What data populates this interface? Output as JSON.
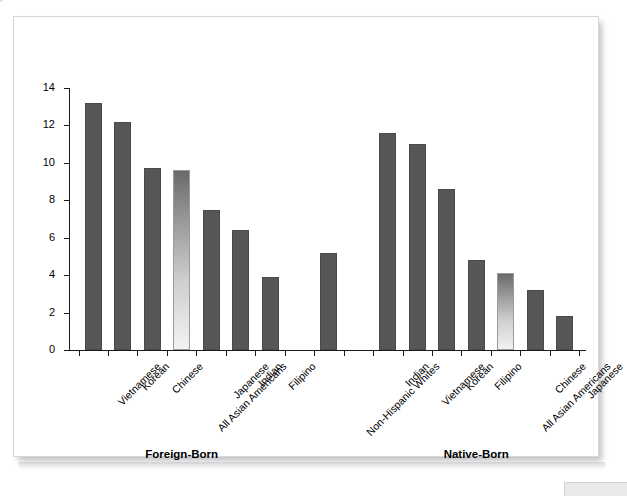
{
  "page": {
    "top_cut_text": "p"
  },
  "chart_data": {
    "type": "bar",
    "title": "",
    "subtitle": "",
    "xlabel": "",
    "ylabel": "",
    "ylim": [
      0,
      14
    ],
    "ytick_step": 2,
    "ytick_labels": [
      "0",
      "2",
      "4",
      "6",
      "8",
      "10",
      "12",
      "14"
    ],
    "grid": false,
    "legend_position": "none",
    "groups": [
      {
        "name": "Foreign-Born",
        "label": "Foreign-Born"
      },
      {
        "name": "Native-Born",
        "label": "Native-Born"
      }
    ],
    "categories": [
      "Vietnamese",
      "Korean",
      "Chinese",
      "All Asian Americans",
      "Japanese",
      "Indian",
      "Filipino",
      "",
      "Non-Hispanic Whites",
      "",
      "Indian",
      "Vietnamese",
      "Korean",
      "Filipino",
      "All Asian Americans",
      "Chinese",
      "Japanese"
    ],
    "values": [
      13.2,
      12.2,
      9.7,
      9.6,
      7.5,
      6.4,
      3.9,
      null,
      5.2,
      null,
      11.6,
      11.0,
      8.6,
      4.8,
      4.1,
      3.2,
      1.8
    ],
    "bars": [
      {
        "label": "Vietnamese",
        "value": 13.2,
        "group": "Foreign-Born",
        "style": "solid"
      },
      {
        "label": "Korean",
        "value": 12.2,
        "group": "Foreign-Born",
        "style": "solid"
      },
      {
        "label": "Chinese",
        "value": 9.7,
        "group": "Foreign-Born",
        "style": "solid"
      },
      {
        "label": "All Asian Americans",
        "value": 9.6,
        "group": "Foreign-Born",
        "style": "gradient"
      },
      {
        "label": "Japanese",
        "value": 7.5,
        "group": "Foreign-Born",
        "style": "solid"
      },
      {
        "label": "Indian",
        "value": 6.4,
        "group": "Foreign-Born",
        "style": "solid"
      },
      {
        "label": "Filipino",
        "value": 3.9,
        "group": "Foreign-Born",
        "style": "solid"
      },
      {
        "label": "Non-Hispanic Whites",
        "value": 5.2,
        "group": "Foreign-Born",
        "style": "solid"
      },
      {
        "label": "Indian",
        "value": 11.6,
        "group": "Native-Born",
        "style": "solid"
      },
      {
        "label": "Vietnamese",
        "value": 11.0,
        "group": "Native-Born",
        "style": "solid"
      },
      {
        "label": "Korean",
        "value": 8.6,
        "group": "Native-Born",
        "style": "solid"
      },
      {
        "label": "Filipino",
        "value": 4.8,
        "group": "Native-Born",
        "style": "solid"
      },
      {
        "label": "All Asian Americans",
        "value": 4.1,
        "group": "Native-Born",
        "style": "gradient"
      },
      {
        "label": "Chinese",
        "value": 3.2,
        "group": "Native-Born",
        "style": "solid"
      },
      {
        "label": "Japanese",
        "value": 1.8,
        "group": "Native-Born",
        "style": "solid"
      }
    ],
    "colors": {
      "bar_solid": "#565656",
      "bar_gradient_top": "#6a6a6a",
      "bar_gradient_bottom": "#f2f2f2",
      "axis": "#1a1a1a",
      "text": "#000000",
      "plot_background": "#ffffff"
    }
  }
}
